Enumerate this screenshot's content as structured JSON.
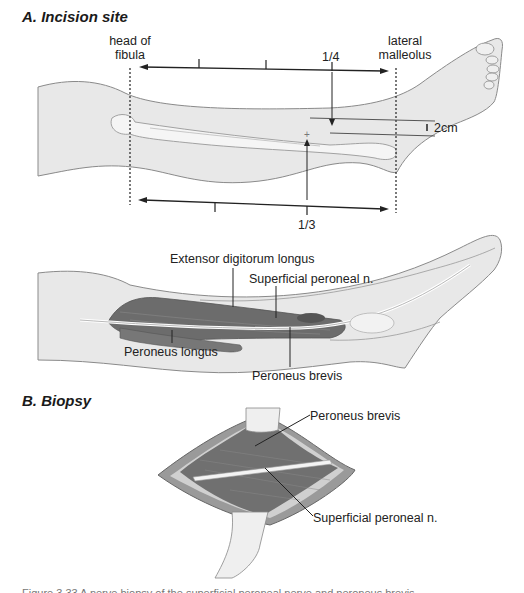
{
  "figure": {
    "panel_a": {
      "title": "A. Incision site",
      "labels": {
        "head_of_fibula": "head of fibula",
        "head_of_fibula_line1": "head of",
        "head_of_fibula_line2": "fibula",
        "lateral_malleolus_line1": "lateral",
        "lateral_malleolus_line2": "malleolus",
        "quarter": "1/4",
        "third": "1/3",
        "distance": "2cm"
      },
      "anatomy_labels": {
        "extensor": "Extensor digitorum longus",
        "sup_peroneal": "Superficial peroneal n.",
        "peroneus_longus": "Peroneus longus",
        "peroneus_brevis": "Peroneus brevis"
      }
    },
    "panel_b": {
      "title": "B. Biopsy",
      "labels": {
        "peroneus_brevis": "Peroneus brevis",
        "sup_peroneal": "Superficial peroneal n."
      }
    },
    "caption_clipped": "Figure 3.33  A nerve biopsy of the superficial peroneal nerve and peroneus brevis"
  },
  "colors": {
    "skin": "#e6e6e6",
    "outline": "#8a8a8a",
    "muscle": "#6e6e6e",
    "bone": "#f4f4f4"
  }
}
